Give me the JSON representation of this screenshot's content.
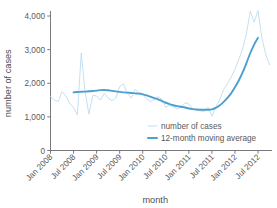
{
  "chart_data": {
    "type": "line",
    "title": "",
    "xlabel": "month",
    "ylabel": "number of cases",
    "ylim": [
      0,
      4400
    ],
    "yticks": [
      0,
      1000,
      2000,
      3000,
      4000
    ],
    "ytick_labels": [
      "0",
      "1,000",
      "2,000",
      "3,000",
      "4,000"
    ],
    "grid": false,
    "legend_position": "inside-bottom-right",
    "xtick_labels": [
      "Jan 2008",
      "Jul 2008",
      "Jan 2009",
      "Jul 2009",
      "Jan 2010",
      "Jul 2010",
      "Jan 2011",
      "Jul 2011",
      "Jan 2012",
      "Jul 2012"
    ],
    "x": [
      "Jan 2008",
      "Feb 2008",
      "Mar 2008",
      "Apr 2008",
      "May 2008",
      "Jun 2008",
      "Jul 2008",
      "Aug 2008",
      "Sep 2008",
      "Oct 2008",
      "Nov 2008",
      "Dec 2008",
      "Jan 2009",
      "Feb 2009",
      "Mar 2009",
      "Apr 2009",
      "May 2009",
      "Jun 2009",
      "Jul 2009",
      "Aug 2009",
      "Sep 2009",
      "Oct 2009",
      "Nov 2009",
      "Dec 2009",
      "Jan 2010",
      "Feb 2010",
      "Mar 2010",
      "Apr 2010",
      "May 2010",
      "Jun 2010",
      "Jul 2010",
      "Aug 2010",
      "Sep 2010",
      "Oct 2010",
      "Nov 2010",
      "Dec 2010",
      "Jan 2011",
      "Feb 2011",
      "Mar 2011",
      "Apr 2011",
      "May 2011",
      "Jun 2011",
      "Jul 2011",
      "Aug 2011",
      "Sep 2011",
      "Oct 2011",
      "Nov 2011",
      "Dec 2011",
      "Jan 2012",
      "Feb 2012",
      "Mar 2012",
      "Apr 2012",
      "May 2012",
      "Jun 2012",
      "Jul 2012",
      "Aug 2012",
      "Sep 2012",
      "Oct 2012"
    ],
    "series": [
      {
        "name": "number of cases",
        "color": "#bcdcef",
        "width": 0.9,
        "values": [
          1600,
          1500,
          1450,
          1750,
          1620,
          1400,
          1280,
          1060,
          2900,
          1750,
          1080,
          1640,
          1620,
          1500,
          1700,
          1560,
          1480,
          1560,
          1900,
          1980,
          1700,
          1560,
          1820,
          1720,
          1700,
          1540,
          1450,
          1520,
          1600,
          1520,
          1280,
          1340,
          1300,
          1240,
          1300,
          1420,
          1380,
          1250,
          1200,
          1180,
          1150,
          1290,
          1020,
          1280,
          1500,
          1800,
          1980,
          2180,
          2420,
          2700,
          3020,
          3480,
          4150,
          3820,
          4160,
          3360,
          2860,
          2550
        ]
      },
      {
        "name": "12-month moving average",
        "color": "#4e9fd0",
        "width": 1.9,
        "values": [
          null,
          null,
          null,
          null,
          null,
          null,
          1730,
          1740,
          1745,
          1752,
          1760,
          1768,
          1780,
          1795,
          1800,
          1790,
          1775,
          1760,
          1742,
          1730,
          1720,
          1712,
          1700,
          1690,
          1670,
          1640,
          1600,
          1560,
          1520,
          1470,
          1420,
          1380,
          1345,
          1320,
          1300,
          1280,
          1250,
          1230,
          1218,
          1212,
          1210,
          1212,
          1225,
          1270,
          1340,
          1440,
          1560,
          1700,
          1880,
          2080,
          2320,
          2600,
          2900,
          3150,
          3350,
          null,
          null,
          null
        ]
      }
    ]
  },
  "legend": {
    "entries": [
      {
        "label": "number of cases"
      },
      {
        "label": "12-month moving average"
      }
    ]
  },
  "axes": {
    "x_title": "month",
    "y_title": "number of cases"
  }
}
